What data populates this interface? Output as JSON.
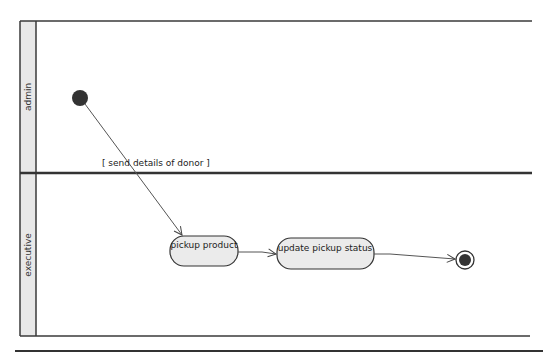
{
  "diagram": {
    "type": "UML activity diagram with swimlanes",
    "lanes": [
      {
        "id": "admin",
        "label": "admin"
      },
      {
        "id": "executive",
        "label": "executive"
      }
    ],
    "nodes": [
      {
        "id": "initial",
        "kind": "initial-node",
        "lane": "admin"
      },
      {
        "id": "pickup_product",
        "kind": "action",
        "lane": "executive",
        "label": "pickup product"
      },
      {
        "id": "update_pickup_status",
        "kind": "action",
        "lane": "executive",
        "label": "update pickup status"
      },
      {
        "id": "final",
        "kind": "final-node",
        "lane": "executive"
      }
    ],
    "edges": [
      {
        "from": "initial",
        "to": "pickup_product",
        "guard": "[ send details of donor ]"
      },
      {
        "from": "pickup_product",
        "to": "update_pickup_status"
      },
      {
        "from": "update_pickup_status",
        "to": "final"
      }
    ],
    "colors": {
      "lane_header_fill": "#e8e8e8",
      "border": "#3a3a3a",
      "action_fill": "#ebebeb",
      "node_fill": "#333333"
    }
  }
}
